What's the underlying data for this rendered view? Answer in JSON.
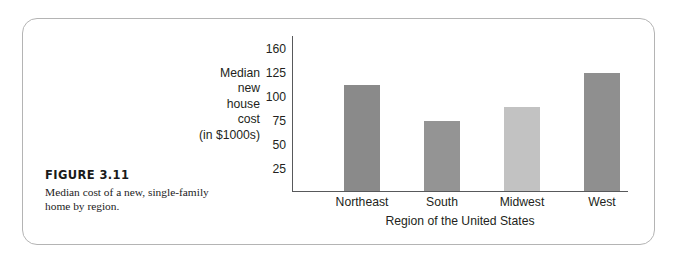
{
  "figure": {
    "number_label": "FIGURE 3.11",
    "caption": "Median cost of a new, single-family home by region."
  },
  "chart_data": {
    "type": "bar",
    "title": "",
    "categories": [
      "Northeast",
      "South",
      "Midwest",
      "West"
    ],
    "values": [
      112,
      75,
      90,
      125
    ],
    "xlabel": "Region of the United States",
    "ylabel": "Median new house cost (in $1000s)",
    "ylabel_lines": [
      "Median",
      "new",
      "house",
      "cost",
      "(in $1000s)"
    ],
    "ytick_labels": [
      "160",
      "125",
      "100",
      "75",
      "50",
      "25"
    ],
    "ytick_values": [
      160,
      125,
      100,
      75,
      50,
      25
    ],
    "ylim": [
      0,
      160
    ],
    "grid": false,
    "legend": null,
    "bar_colors": [
      "#8a8a8a",
      "#949494",
      "#c2c2c2",
      "#8f8f8f"
    ],
    "axis_color": "#58595b",
    "note": "Vertical axis ticks are evenly spaced although the 160 tick breaks the 25-unit pattern."
  },
  "style": {
    "frame_border_color": "#b4b4b4",
    "text_color": "#231f20",
    "background": "#ffffff"
  }
}
